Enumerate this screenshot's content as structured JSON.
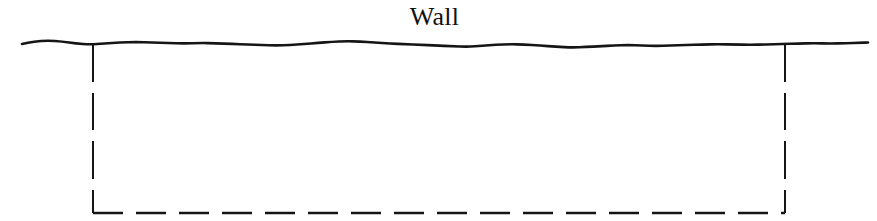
{
  "figure": {
    "type": "engineering-cross-section-diagram",
    "width": 877,
    "height": 221,
    "background_color": "#ffffff",
    "line_color": "#151515",
    "labels": {
      "wall": "Wall"
    },
    "elements": {
      "ground_surface": {
        "name": "ground-surface-line",
        "description": "irregular hand-drawn horizontal ground / wall top line",
        "style": "solid",
        "stroke_width": 2.6,
        "x_start": 22,
        "x_end": 868,
        "y_nominal": 44
      },
      "left_excavation_edge": {
        "name": "left-excavation-edge",
        "style": "solid-then-dashed",
        "x": 93,
        "y_top": 44,
        "y_bottom": 213,
        "solid_to": 82,
        "dash": 37,
        "gap": 11
      },
      "right_excavation_edge": {
        "name": "right-excavation-edge",
        "style": "solid-then-dashed",
        "x": 785,
        "y_top": 44,
        "y_bottom": 213,
        "solid_to": 82,
        "dash": 37,
        "gap": 11
      },
      "excavation_base": {
        "name": "excavation-base-line",
        "style": "dashed",
        "y": 213,
        "x_start": 93,
        "x_end": 785,
        "dash": 30,
        "gap": 13
      }
    },
    "ground_profile_points": [
      [
        22,
        44
      ],
      [
        34,
        41.5
      ],
      [
        48,
        40.5
      ],
      [
        62,
        41.5
      ],
      [
        76,
        43.5
      ],
      [
        90,
        44.5
      ],
      [
        104,
        43.5
      ],
      [
        120,
        42.5
      ],
      [
        136,
        42.0
      ],
      [
        152,
        42.5
      ],
      [
        168,
        43.0
      ],
      [
        184,
        43.5
      ],
      [
        200,
        43.0
      ],
      [
        216,
        43.2
      ],
      [
        232,
        44.0
      ],
      [
        248,
        44.5
      ],
      [
        262,
        45.0
      ],
      [
        276,
        45.5
      ],
      [
        290,
        45.0
      ],
      [
        304,
        44.0
      ],
      [
        318,
        43.0
      ],
      [
        332,
        41.8
      ],
      [
        346,
        41.2
      ],
      [
        360,
        41.5
      ],
      [
        374,
        42.5
      ],
      [
        390,
        43.5
      ],
      [
        406,
        44.2
      ],
      [
        420,
        44.8
      ],
      [
        436,
        45.5
      ],
      [
        452,
        46.2
      ],
      [
        468,
        46.8
      ],
      [
        482,
        45.8
      ],
      [
        496,
        44.8
      ],
      [
        510,
        44.2
      ],
      [
        524,
        44.5
      ],
      [
        540,
        45.5
      ],
      [
        556,
        46.8
      ],
      [
        572,
        47.5
      ],
      [
        586,
        47.0
      ],
      [
        600,
        46.2
      ],
      [
        614,
        45.5
      ],
      [
        628,
        45.0
      ],
      [
        642,
        45.5
      ],
      [
        656,
        46.0
      ],
      [
        670,
        45.5
      ],
      [
        686,
        45.0
      ],
      [
        702,
        44.5
      ],
      [
        718,
        44.2
      ],
      [
        734,
        44.5
      ],
      [
        750,
        44.8
      ],
      [
        766,
        44.5
      ],
      [
        782,
        44.0
      ],
      [
        798,
        43.5
      ],
      [
        814,
        43.2
      ],
      [
        830,
        43.5
      ],
      [
        846,
        43.2
      ],
      [
        860,
        42.8
      ],
      [
        868,
        42.5
      ]
    ]
  }
}
